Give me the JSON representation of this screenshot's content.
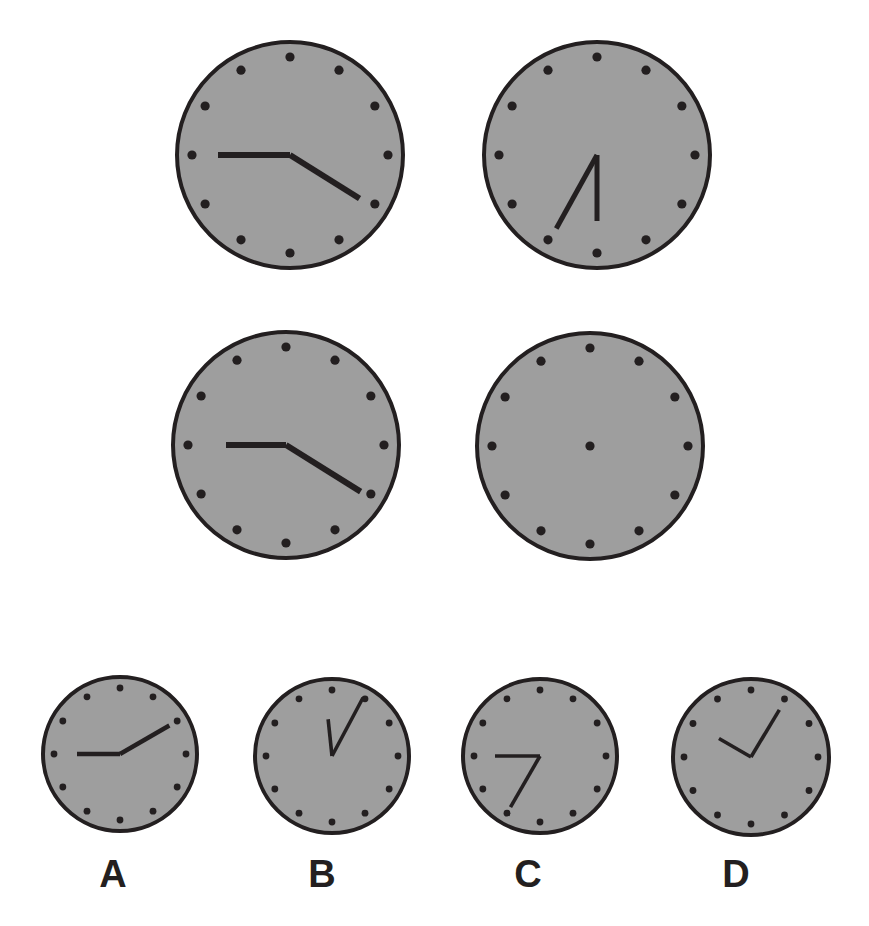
{
  "page": {
    "type": "clock-analogy-puzzle",
    "width": 869,
    "height": 926,
    "background_color": "#ffffff"
  },
  "style": {
    "face_fill": "#9e9e9e",
    "face_stroke": "#231f20",
    "face_stroke_width": 4,
    "hand_color": "#231f20",
    "marker_color": "#231f20",
    "marker_count": 12
  },
  "matrix": {
    "name": "2x2-analogy-matrix",
    "cells": [
      {
        "id": "cell-1",
        "position": "top-left",
        "cx": 290,
        "cy": 155,
        "r": 113,
        "marker_radius": 98,
        "marker_dot_size": 4.6,
        "center_dot": false,
        "hands": [
          {
            "name": "hour-hand",
            "angle_deg": 270,
            "length": 72,
            "width": 6
          },
          {
            "name": "minute-hand",
            "angle_deg": 122,
            "length": 82,
            "width": 6
          }
        ]
      },
      {
        "id": "cell-2",
        "position": "top-right",
        "cx": 597,
        "cy": 155,
        "r": 113,
        "marker_radius": 98,
        "marker_dot_size": 4.6,
        "center_dot": false,
        "hands": [
          {
            "name": "hour-hand",
            "angle_deg": 180,
            "length": 66,
            "width": 5
          },
          {
            "name": "minute-hand",
            "angle_deg": 209,
            "length": 84,
            "width": 5
          }
        ]
      },
      {
        "id": "cell-3",
        "position": "bottom-left",
        "cx": 286,
        "cy": 445,
        "r": 113,
        "marker_radius": 98,
        "marker_dot_size": 4.6,
        "center_dot": false,
        "hands": [
          {
            "name": "hour-hand",
            "angle_deg": 270,
            "length": 60,
            "width": 6
          },
          {
            "name": "minute-hand",
            "angle_deg": 122,
            "length": 88,
            "width": 6
          }
        ]
      },
      {
        "id": "cell-4-missing",
        "position": "bottom-right",
        "cx": 590,
        "cy": 446,
        "r": 113,
        "marker_radius": 98,
        "marker_dot_size": 4.6,
        "center_dot": true,
        "hands": []
      }
    ]
  },
  "options": {
    "name": "answer-options-row",
    "items": [
      {
        "id": "option-a",
        "label": "A",
        "cx": 120,
        "cy": 754,
        "r": 77,
        "label_x": 113,
        "label_y": 855,
        "marker_radius": 66,
        "marker_dot_size": 3.4,
        "center_dot": false,
        "hands": [
          {
            "name": "hour-hand",
            "angle_deg": 270,
            "length": 43,
            "width": 4.4
          },
          {
            "name": "minute-hand",
            "angle_deg": 60,
            "length": 57,
            "width": 4.4
          }
        ]
      },
      {
        "id": "option-b",
        "label": "B",
        "cx": 332,
        "cy": 756,
        "r": 77,
        "label_x": 322,
        "label_y": 855,
        "marker_radius": 66,
        "marker_dot_size": 3.4,
        "center_dot": false,
        "hands": [
          {
            "name": "hour-hand",
            "angle_deg": 354,
            "length": 37,
            "width": 3.6
          },
          {
            "name": "minute-hand",
            "angle_deg": 28,
            "length": 66,
            "width": 3.6
          }
        ]
      },
      {
        "id": "option-c",
        "label": "C",
        "cx": 540,
        "cy": 756,
        "r": 77,
        "label_x": 528,
        "label_y": 855,
        "marker_radius": 66,
        "marker_dot_size": 3.4,
        "center_dot": false,
        "hands": [
          {
            "name": "hour-hand",
            "angle_deg": 270,
            "length": 45,
            "width": 3.6
          },
          {
            "name": "minute-hand",
            "angle_deg": 210,
            "length": 59,
            "width": 3.6
          }
        ]
      },
      {
        "id": "option-d",
        "label": "D",
        "cx": 751,
        "cy": 757,
        "r": 78,
        "label_x": 736,
        "label_y": 855,
        "marker_radius": 67,
        "marker_dot_size": 3.4,
        "center_dot": false,
        "hands": [
          {
            "name": "hour-hand",
            "angle_deg": 300,
            "length": 37,
            "width": 3.6
          },
          {
            "name": "minute-hand",
            "angle_deg": 31,
            "length": 55,
            "width": 3.6
          }
        ]
      }
    ]
  }
}
